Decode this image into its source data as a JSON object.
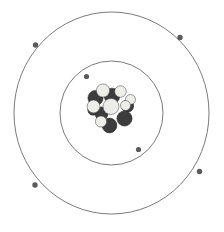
{
  "diagram": {
    "canvas": {
      "width": 224,
      "height": 232,
      "background": "#ffffff"
    },
    "center": {
      "x": 111.5,
      "y": 113
    },
    "colors": {
      "ring_stroke": "#6b6b6b",
      "electron": "#5a5a5a",
      "proton": "#ededea",
      "neutron": "#3c3c3c",
      "nucleon_outline": "#4a4a4a",
      "background": "#ffffff"
    },
    "shells": [
      {
        "name": "inner-shell",
        "label": "K shell",
        "radius_x": 51.5,
        "radius_y": 52,
        "electron_count": 2
      },
      {
        "name": "outer-shell",
        "label": "L shell",
        "radius_x": 97.5,
        "radius_y": 101,
        "electron_count": 4
      }
    ],
    "electrons": [
      {
        "shell": "inner-shell",
        "cx": 86.5,
        "cy": 76.5,
        "r": 2.6
      },
      {
        "shell": "inner-shell",
        "cx": 138.5,
        "cy": 149.5,
        "r": 2.6
      },
      {
        "shell": "outer-shell",
        "cx": 35.5,
        "cy": 45.0,
        "r": 2.7
      },
      {
        "shell": "outer-shell",
        "cx": 180.0,
        "cy": 37.5,
        "r": 2.7
      },
      {
        "shell": "outer-shell",
        "cx": 35.0,
        "cy": 185.0,
        "r": 2.7
      },
      {
        "shell": "outer-shell",
        "cx": 199.5,
        "cy": 171.5,
        "r": 2.7
      }
    ],
    "nucleus": {
      "name": "nucleus",
      "proton_count": 7,
      "neutron_count": 7,
      "bounds": {
        "x": 88,
        "y": 86,
        "width": 46,
        "height": 44
      },
      "particles": [
        {
          "type": "neutron",
          "cx": 95.5,
          "cy": 98.0,
          "r": 7.6
        },
        {
          "type": "neutron",
          "cx": 112.0,
          "cy": 96.0,
          "r": 7.8
        },
        {
          "type": "neutron",
          "cx": 127.5,
          "cy": 106.0,
          "r": 6.2
        },
        {
          "type": "neutron",
          "cx": 101.5,
          "cy": 113.5,
          "r": 6.6
        },
        {
          "type": "neutron",
          "cx": 124.5,
          "cy": 118.5,
          "r": 7.6
        },
        {
          "type": "neutron",
          "cx": 109.5,
          "cy": 125.5,
          "r": 7.4
        },
        {
          "type": "neutron",
          "cx": 93.0,
          "cy": 110.0,
          "r": 5.2
        },
        {
          "type": "proton",
          "cx": 103.0,
          "cy": 90.5,
          "r": 6.6
        },
        {
          "type": "proton",
          "cx": 120.5,
          "cy": 91.5,
          "r": 5.8
        },
        {
          "type": "proton",
          "cx": 130.5,
          "cy": 99.5,
          "r": 5.0
        },
        {
          "type": "proton",
          "cx": 93.5,
          "cy": 106.5,
          "r": 6.4
        },
        {
          "type": "proton",
          "cx": 111.0,
          "cy": 106.5,
          "r": 8.0
        },
        {
          "type": "proton",
          "cx": 125.5,
          "cy": 105.5,
          "r": 5.0
        },
        {
          "type": "proton",
          "cx": 101.0,
          "cy": 121.5,
          "r": 5.6
        }
      ]
    }
  }
}
